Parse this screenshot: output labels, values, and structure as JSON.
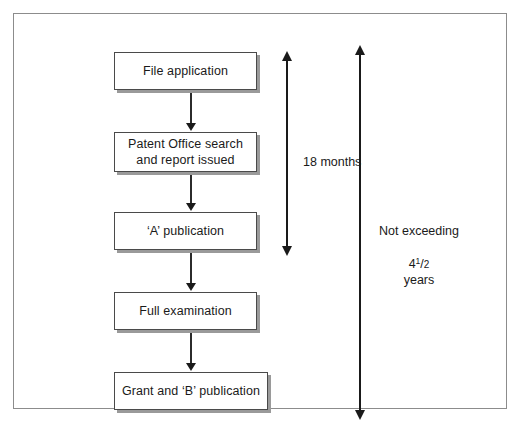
{
  "figure": {
    "background_color": "#ffffff",
    "frame_border_color": "#8c8c8c"
  },
  "flow": {
    "steps": [
      {
        "id": "file-application",
        "label": "File application"
      },
      {
        "id": "patent-office-search",
        "label": "Patent Office search\nand report issued"
      },
      {
        "id": "a-publication",
        "label": "‘A’ publication"
      },
      {
        "id": "full-examination",
        "label": "Full examination"
      },
      {
        "id": "grant-and-b-publication",
        "label": "Grant and ‘B’ publication"
      }
    ],
    "connector_count": 4,
    "box_border_color": "#4a4a4a",
    "box_shadow_color": "#9a9a9a"
  },
  "annotations": {
    "eighteen_months": {
      "label": "18 months",
      "spans_from": "File application",
      "spans_to": "‘A’ publication"
    },
    "max_duration": {
      "line1": "Not exceeding",
      "value_whole": "4",
      "value_numerator": "1",
      "value_slash": "/",
      "value_denominator": "2",
      "unit": "years",
      "spans_from": "File application",
      "spans_to": "Grant and ‘B’ publication"
    }
  }
}
